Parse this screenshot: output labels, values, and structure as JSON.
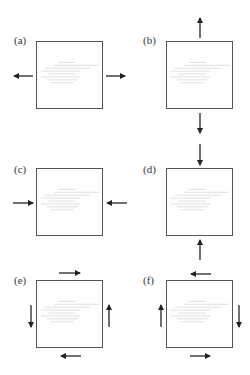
{
  "diagram": {
    "panels": [
      {
        "id": "a",
        "label": "(a)",
        "loading": "tension-horizontal",
        "arrows": [
          "left-outward",
          "right-outward"
        ]
      },
      {
        "id": "b",
        "label": "(b)",
        "loading": "tension-vertical",
        "arrows": [
          "top-outward",
          "bottom-outward"
        ]
      },
      {
        "id": "c",
        "label": "(c)",
        "loading": "compression-horizontal",
        "arrows": [
          "left-inward",
          "right-inward"
        ]
      },
      {
        "id": "d",
        "label": "(d)",
        "loading": "compression-vertical",
        "arrows": [
          "top-inward",
          "bottom-inward"
        ]
      },
      {
        "id": "e",
        "label": "(e)",
        "loading": "shear-counterclockwise",
        "arrows": [
          "top-right",
          "bottom-left",
          "left-down",
          "right-up"
        ]
      },
      {
        "id": "f",
        "label": "(f)",
        "loading": "shear-clockwise",
        "arrows": [
          "top-left",
          "bottom-right",
          "left-up",
          "right-down"
        ]
      }
    ],
    "colors": {
      "stroke": "#555555",
      "arrow": "#222222",
      "hatch": "#c8c8c8",
      "label": "#333333"
    }
  }
}
